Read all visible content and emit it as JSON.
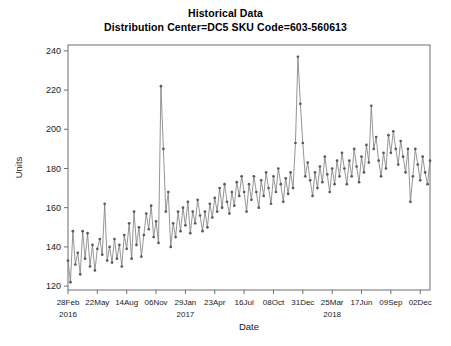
{
  "chart_data": {
    "type": "line",
    "title": "Historical Data",
    "subtitle": "Distribution Center=DC5 SKU Code=603-560613",
    "xlabel": "Date",
    "ylabel": "Units",
    "ylim": [
      118,
      243
    ],
    "yticks": [
      120,
      140,
      160,
      180,
      200,
      220,
      240
    ],
    "grid": false,
    "legend": "none",
    "marker": "circle",
    "line_color": "#7a7a7a",
    "marker_color": "#5a5a5a",
    "xtick_labels": [
      "28Feb",
      "22May",
      "14Aug",
      "06Nov",
      "29Jan",
      "23Apr",
      "16Jul",
      "08Oct",
      "31Dec",
      "25Mar",
      "17Jun",
      "09Sep",
      "02Dec"
    ],
    "xtick_indices": [
      0,
      12,
      24,
      36,
      48,
      60,
      72,
      84,
      96,
      108,
      120,
      132,
      144
    ],
    "year_labels": [
      {
        "text": "2016",
        "index": 0
      },
      {
        "text": "2017",
        "index": 48
      },
      {
        "text": "2018",
        "index": 108
      }
    ],
    "x_index_range": [
      0,
      148
    ],
    "series": [
      {
        "name": "Units",
        "values": [
          133,
          122,
          148,
          131,
          137,
          126,
          148,
          134,
          147,
          130,
          141,
          128,
          139,
          144,
          136,
          162,
          133,
          140,
          132,
          144,
          134,
          141,
          130,
          146,
          139,
          152,
          134,
          158,
          141,
          150,
          135,
          146,
          157,
          149,
          161,
          145,
          153,
          142,
          222,
          190,
          158,
          168,
          140,
          152,
          145,
          158,
          148,
          160,
          151,
          163,
          147,
          158,
          152,
          164,
          156,
          148,
          158,
          150,
          162,
          155,
          165,
          158,
          170,
          160,
          172,
          163,
          157,
          168,
          161,
          173,
          166,
          176,
          168,
          158,
          172,
          164,
          176,
          168,
          160,
          174,
          166,
          178,
          170,
          162,
          176,
          168,
          180,
          172,
          163,
          175,
          167,
          178,
          170,
          193,
          237,
          213,
          193,
          176,
          183,
          174,
          166,
          178,
          170,
          181,
          173,
          186,
          177,
          168,
          180,
          172,
          184,
          176,
          188,
          180,
          172,
          184,
          176,
          190,
          181,
          173,
          186,
          178,
          192,
          183,
          212,
          190,
          196,
          184,
          176,
          188,
          180,
          197,
          188,
          199,
          190,
          182,
          194,
          186,
          178,
          190,
          163,
          176,
          190,
          182,
          174,
          186,
          178,
          172,
          184
        ]
      }
    ]
  }
}
